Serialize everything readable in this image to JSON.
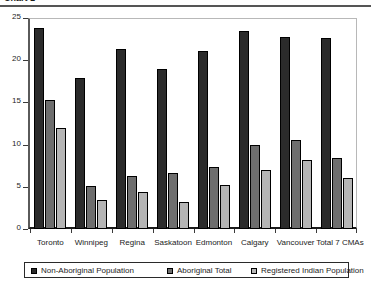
{
  "title": {
    "text": "Chart 1",
    "clipped": true
  },
  "chart_data": {
    "type": "bar",
    "title": "",
    "xlabel": "",
    "ylabel": "",
    "ylim": [
      0,
      25
    ],
    "yticks": [
      0,
      5,
      10,
      15,
      20,
      25
    ],
    "grid": false,
    "legend_position": "bottom",
    "categories": [
      "Toronto",
      "Winnipeg",
      "Regina",
      "Saskatoon",
      "Edmonton",
      "Calgary",
      "Vancouver",
      "Total 7 CMAs"
    ],
    "series": [
      {
        "name": "Non-Aboriginal Population",
        "color": "#2b2b2b",
        "values": [
          23.8,
          17.9,
          21.3,
          19.0,
          21.1,
          23.5,
          22.8,
          22.6
        ]
      },
      {
        "name": "Aboriginal Total",
        "color": "#6e6e6e",
        "values": [
          15.3,
          5.1,
          6.3,
          6.6,
          7.4,
          9.9,
          10.6,
          8.4
        ]
      },
      {
        "name": "Registered Indian Population",
        "color": "#b5b5b5",
        "values": [
          12.0,
          3.4,
          4.4,
          3.2,
          5.2,
          7.0,
          8.2,
          6.0
        ]
      }
    ]
  }
}
